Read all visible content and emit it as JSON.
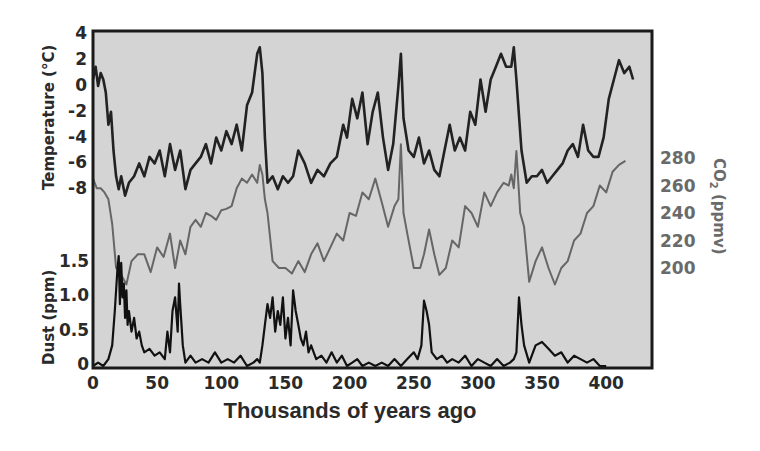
{
  "chart_data": {
    "type": "line",
    "title": "",
    "xlabel": "Thousands of years ago",
    "x_ticks": [
      0,
      50,
      100,
      150,
      200,
      250,
      300,
      350,
      400
    ],
    "xlim": [
      0,
      422
    ],
    "grid": false,
    "legend": null,
    "background_color": "#d4d4d4",
    "axes": {
      "temperature": {
        "label": "Temperature (°C)",
        "side": "left",
        "ticks": [
          4,
          2,
          0,
          -2,
          -4,
          -6,
          -8
        ],
        "ylim": [
          -9,
          4
        ],
        "color": "#222222"
      },
      "co2": {
        "label": "CO2 (ppmv)",
        "side": "right",
        "ticks": [
          280,
          260,
          240,
          220,
          200
        ],
        "ylim": [
          180,
          300
        ],
        "color": "#6a6a6a"
      },
      "dust": {
        "label": "Dust (ppm)",
        "side": "left",
        "ticks": [
          1.5,
          1.0,
          0.5,
          0
        ],
        "ylim": [
          0,
          1.8
        ],
        "color": "#111111"
      }
    },
    "series": [
      {
        "name": "Temperature",
        "axis": "temperature",
        "color": "#222222",
        "width": 2.6,
        "x": [
          0,
          2,
          4,
          6,
          8,
          10,
          12,
          14,
          16,
          18,
          20,
          22,
          25,
          28,
          32,
          36,
          40,
          44,
          48,
          52,
          56,
          60,
          64,
          68,
          72,
          76,
          80,
          84,
          88,
          92,
          96,
          100,
          104,
          108,
          112,
          116,
          120,
          124,
          128,
          130,
          132,
          134,
          136,
          140,
          144,
          148,
          152,
          156,
          160,
          165,
          170,
          175,
          180,
          185,
          190,
          195,
          198,
          202,
          206,
          210,
          214,
          218,
          222,
          226,
          230,
          234,
          238,
          240,
          242,
          246,
          250,
          254,
          258,
          262,
          266,
          270,
          274,
          278,
          282,
          286,
          290,
          294,
          298,
          302,
          306,
          310,
          314,
          318,
          322,
          326,
          328,
          330,
          334,
          338,
          342,
          346,
          350,
          354,
          358,
          362,
          366,
          370,
          374,
          378,
          382,
          386,
          390,
          394,
          398,
          402,
          406,
          410,
          414,
          418,
          421
        ],
        "values": [
          0.5,
          1.5,
          0.0,
          1.0,
          0.5,
          -0.5,
          -3.0,
          -2.0,
          -5.0,
          -7.0,
          -8.0,
          -7.0,
          -8.5,
          -7.5,
          -7.0,
          -6.0,
          -7.0,
          -5.5,
          -6.0,
          -5.0,
          -7.0,
          -4.5,
          -6.5,
          -5.0,
          -8.0,
          -6.5,
          -6.0,
          -5.5,
          -4.5,
          -6.0,
          -4.0,
          -5.0,
          -3.5,
          -4.5,
          -3.0,
          -5.0,
          -1.5,
          -0.5,
          2.5,
          3.0,
          1.0,
          -4.0,
          -7.5,
          -7.0,
          -8.0,
          -7.0,
          -7.5,
          -7.0,
          -5.0,
          -6.0,
          -7.5,
          -6.5,
          -7.0,
          -6.0,
          -5.5,
          -3.0,
          -4.0,
          -1.0,
          -2.5,
          -0.5,
          -4.5,
          -2.0,
          -0.5,
          -4.0,
          -6.5,
          -4.5,
          0.0,
          2.5,
          -2.5,
          -5.0,
          -5.5,
          -4.0,
          -6.0,
          -5.0,
          -6.5,
          -7.0,
          -5.0,
          -3.0,
          -5.0,
          -4.0,
          -5.0,
          -2.0,
          -3.0,
          0.5,
          -2.0,
          0.5,
          1.5,
          2.5,
          1.5,
          1.5,
          3.0,
          0.5,
          -5.0,
          -7.5,
          -7.0,
          -7.0,
          -6.5,
          -7.5,
          -7.0,
          -6.5,
          -6.0,
          -5.0,
          -4.5,
          -5.5,
          -3.0,
          -5.0,
          -5.5,
          -5.5,
          -4.0,
          -1.0,
          0.5,
          2.0,
          1.0,
          1.5,
          0.5
        ]
      },
      {
        "name": "CO2",
        "axis": "co2",
        "color": "#666666",
        "width": 2.0,
        "x": [
          0,
          3,
          6,
          9,
          12,
          15,
          18,
          22,
          26,
          30,
          35,
          40,
          45,
          50,
          55,
          60,
          64,
          68,
          72,
          76,
          80,
          84,
          88,
          92,
          96,
          100,
          104,
          108,
          112,
          116,
          120,
          124,
          128,
          130,
          132,
          134,
          136,
          140,
          145,
          150,
          155,
          160,
          165,
          170,
          175,
          180,
          185,
          190,
          195,
          200,
          205,
          210,
          215,
          220,
          225,
          230,
          235,
          238,
          240,
          242,
          245,
          250,
          255,
          258,
          262,
          266,
          270,
          275,
          280,
          285,
          290,
          295,
          300,
          305,
          310,
          315,
          320,
          324,
          326,
          328,
          330,
          333,
          336,
          340,
          345,
          350,
          355,
          360,
          365,
          370,
          375,
          380,
          385,
          390,
          395,
          400,
          405,
          410,
          415
        ],
        "values": [
          265,
          258,
          258,
          255,
          250,
          232,
          200,
          195,
          188,
          205,
          210,
          210,
          197,
          215,
          208,
          225,
          200,
          220,
          210,
          230,
          235,
          230,
          240,
          238,
          235,
          242,
          243,
          245,
          258,
          265,
          262,
          268,
          262,
          275,
          268,
          250,
          240,
          205,
          200,
          200,
          196,
          205,
          197,
          210,
          218,
          205,
          215,
          225,
          220,
          240,
          238,
          255,
          250,
          265,
          248,
          230,
          245,
          250,
          290,
          240,
          225,
          200,
          200,
          210,
          228,
          210,
          195,
          200,
          220,
          215,
          245,
          240,
          230,
          255,
          245,
          255,
          262,
          260,
          268,
          258,
          285,
          240,
          230,
          190,
          205,
          215,
          200,
          188,
          200,
          205,
          220,
          225,
          240,
          245,
          260,
          255,
          270,
          275,
          278
        ]
      },
      {
        "name": "Dust",
        "axis": "dust",
        "color": "#111111",
        "width": 2.2,
        "x": [
          0,
          4,
          8,
          12,
          15,
          17,
          19,
          20,
          21,
          22,
          23,
          24,
          25,
          26,
          27,
          28,
          30,
          32,
          34,
          36,
          38,
          40,
          44,
          48,
          52,
          56,
          58,
          60,
          62,
          64,
          66,
          67,
          68,
          70,
          72,
          76,
          80,
          85,
          90,
          95,
          100,
          105,
          110,
          115,
          120,
          125,
          128,
          130,
          132,
          134,
          136,
          138,
          140,
          142,
          144,
          146,
          148,
          150,
          152,
          154,
          156,
          158,
          160,
          162,
          164,
          166,
          168,
          170,
          174,
          178,
          182,
          186,
          190,
          194,
          198,
          202,
          206,
          210,
          215,
          220,
          225,
          230,
          235,
          240,
          245,
          250,
          253,
          256,
          258,
          260,
          262,
          264,
          268,
          272,
          276,
          280,
          285,
          290,
          295,
          300,
          305,
          310,
          315,
          320,
          325,
          328,
          330,
          332,
          334,
          336,
          340,
          345,
          350,
          355,
          360,
          365,
          370,
          375,
          380,
          385,
          390,
          395,
          400
        ],
        "values": [
          0.0,
          0.05,
          0.0,
          0.1,
          0.3,
          0.8,
          1.4,
          1.6,
          0.9,
          1.5,
          1.0,
          1.2,
          0.7,
          1.1,
          0.6,
          0.8,
          0.5,
          0.7,
          0.4,
          0.5,
          0.3,
          0.2,
          0.25,
          0.15,
          0.2,
          0.1,
          0.5,
          0.2,
          0.8,
          1.0,
          0.5,
          1.2,
          0.9,
          0.3,
          0.05,
          0.15,
          0.05,
          0.1,
          0.05,
          0.2,
          0.05,
          0.1,
          0.05,
          0.15,
          0.0,
          0.05,
          0.1,
          0.05,
          0.3,
          0.6,
          0.9,
          0.7,
          1.0,
          0.5,
          0.8,
          0.6,
          1.0,
          0.4,
          0.7,
          0.3,
          1.1,
          0.8,
          0.6,
          0.4,
          0.3,
          0.5,
          0.2,
          0.3,
          0.1,
          0.15,
          0.05,
          0.2,
          0.05,
          0.15,
          0.0,
          0.05,
          0.1,
          0.0,
          0.05,
          0.0,
          0.05,
          0.0,
          0.1,
          0.0,
          0.1,
          0.2,
          0.1,
          0.3,
          0.95,
          0.8,
          0.6,
          0.2,
          0.1,
          0.15,
          0.05,
          0.1,
          0.05,
          0.15,
          0.0,
          0.1,
          0.05,
          0.0,
          0.1,
          0.0,
          0.05,
          0.1,
          0.2,
          1.0,
          0.6,
          0.3,
          0.05,
          0.3,
          0.35,
          0.25,
          0.15,
          0.2,
          0.05,
          0.15,
          0.1,
          0.05,
          0.1,
          0.0,
          0.0
        ]
      }
    ]
  },
  "labels": {
    "temperature_axis": "Temperature (°C)",
    "co2_axis_main": "CO",
    "co2_axis_sub": "2",
    "co2_axis_rest": " (ppmv)",
    "dust_axis": "Dust (ppm)",
    "x_axis": "Thousands of years ago"
  }
}
